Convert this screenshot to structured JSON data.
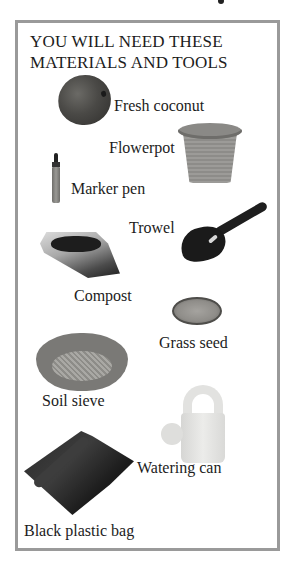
{
  "page": {
    "top_partial_glyph": "y"
  },
  "panel": {
    "title_line1": "YOU WILL NEED THESE",
    "title_line2": "MATERIALS AND TOOLS",
    "border_color": "#9a9a9a",
    "items": [
      {
        "label": "Fresh coconut",
        "icon": "coconut-image"
      },
      {
        "label": "Flowerpot",
        "icon": "flowerpot-image"
      },
      {
        "label": "Marker pen",
        "icon": "marker-pen-image"
      },
      {
        "label": "Trowel",
        "icon": "trowel-image"
      },
      {
        "label": "Compost",
        "icon": "compost-bag-image"
      },
      {
        "label": "Grass seed",
        "icon": "grass-seed-image"
      },
      {
        "label": "Soil sieve",
        "icon": "soil-sieve-image"
      },
      {
        "label": "Watering can",
        "icon": "watering-can-image"
      },
      {
        "label": "Black plastic bag",
        "icon": "black-plastic-bag-image"
      }
    ]
  }
}
